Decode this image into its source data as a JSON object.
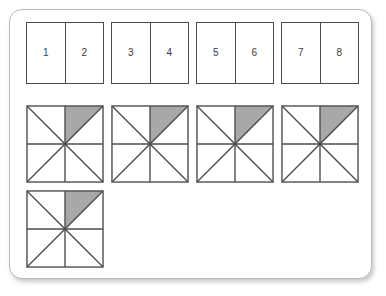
{
  "page": {
    "background_color": "#ffffff",
    "card": {
      "border_color": "#b9b9b9",
      "fill_color": "#ffffff"
    }
  },
  "style": {
    "stroke_color": "#4b4b4b",
    "shaded_color": "#a8a8a8",
    "unshaded_color": "#ffffff",
    "label_color": "#3b3b3b"
  },
  "pair_boxes": [
    {
      "left_label": "1",
      "right_label": "2"
    },
    {
      "left_label": "3",
      "right_label": "4"
    },
    {
      "left_label": "5",
      "right_label": "6"
    },
    {
      "left_label": "7",
      "right_label": "8"
    }
  ],
  "eighths_figures": [
    {
      "total_parts": "8",
      "shaded_parts": "1",
      "shaded_sector": "upper-right-left-half"
    },
    {
      "total_parts": "8",
      "shaded_parts": "1",
      "shaded_sector": "upper-right-left-half"
    },
    {
      "total_parts": "8",
      "shaded_parts": "1",
      "shaded_sector": "upper-right-left-half"
    },
    {
      "total_parts": "8",
      "shaded_parts": "1",
      "shaded_sector": "upper-right-left-half"
    },
    {
      "total_parts": "8",
      "shaded_parts": "1",
      "shaded_sector": "upper-right-left-half"
    }
  ]
}
